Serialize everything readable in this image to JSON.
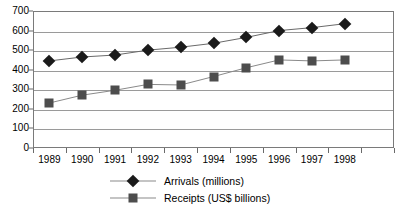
{
  "chart_data": {
    "type": "line",
    "title": "",
    "subtitle": "",
    "xlabel": "",
    "ylabel": "",
    "x": [
      "1989",
      "1990",
      "1991",
      "1992",
      "1993",
      "1994",
      "1995",
      "1996",
      "1997",
      "1998"
    ],
    "categories": [
      "1989",
      "1990",
      "1991",
      "1992",
      "1993",
      "1994",
      "1995",
      "1996",
      "1997",
      "1998"
    ],
    "ylim": [
      0,
      700
    ],
    "yticks": [
      0,
      100,
      200,
      300,
      400,
      500,
      600,
      700
    ],
    "ytick_labels": [
      "0",
      "100",
      "200",
      "300",
      "400",
      "500",
      "600",
      "700"
    ],
    "grid": "horizontal",
    "legend_position": "bottom",
    "series": [
      {
        "name": "Arrivals (millions)",
        "marker": "diamond",
        "color": "#1a1a1a",
        "line_color": "#6a6a6a",
        "values": [
          445,
          465,
          475,
          500,
          515,
          535,
          565,
          600,
          615,
          635
        ]
      },
      {
        "name": "Receipts (US$ billions)",
        "marker": "square",
        "color": "#4d4d4d",
        "line_color": "#8a8a8a",
        "values": [
          230,
          270,
          295,
          325,
          322,
          365,
          410,
          450,
          445,
          450
        ]
      }
    ]
  },
  "legend": {
    "items": [
      {
        "label": "Arrivals (millions)",
        "marker": "diamond"
      },
      {
        "label": "Receipts (US$ billions)",
        "marker": "square"
      }
    ]
  }
}
